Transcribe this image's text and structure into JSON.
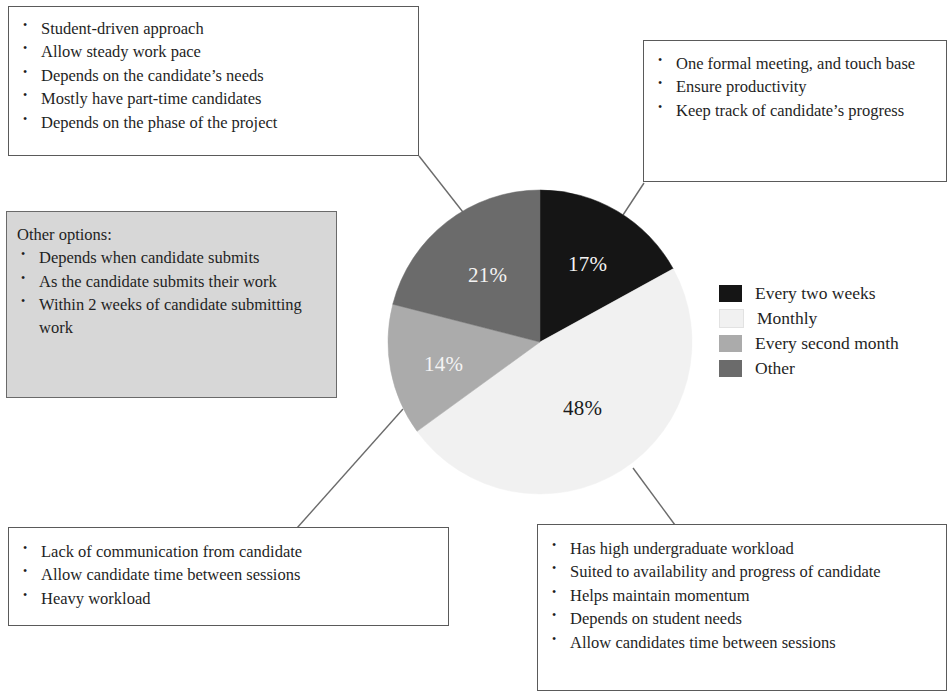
{
  "chart_data": {
    "type": "pie",
    "title": "",
    "categories": [
      "Every two weeks",
      "Monthly",
      "Every second month",
      "Other"
    ],
    "values": [
      17,
      48,
      14,
      21
    ],
    "value_labels": [
      "17%",
      "48%",
      "14%",
      "21%"
    ],
    "colors": [
      "#151515",
      "#f1f1f1",
      "#ababab",
      "#6b6b6b"
    ],
    "label_text_colors": [
      "#f4f4f4",
      "#1b1b1b",
      "#f4f4f4",
      "#f4f4f4"
    ],
    "start_angle_deg": 0,
    "direction": "clockwise",
    "legend_position": "right",
    "grid": false
  },
  "legend": {
    "items": [
      {
        "label": "Every two weeks",
        "color": "#151515"
      },
      {
        "label": "Monthly",
        "color": "#f1f1f1"
      },
      {
        "label": "Every second month",
        "color": "#ababab"
      },
      {
        "label": "Other",
        "color": "#6b6b6b"
      }
    ]
  },
  "callouts": {
    "top_left": {
      "items": [
        "Student-driven approach",
        "Allow steady work pace",
        "Depends on the candidate’s needs",
        "Mostly have part-time candidates",
        "Depends on the phase of the project"
      ]
    },
    "top_right": {
      "items": [
        "One formal meeting, and touch base",
        "Ensure productivity",
        "Keep track of candidate’s progress"
      ]
    },
    "other_options": {
      "heading": "Other options:",
      "items": [
        "Depends when candidate submits",
        "As the candidate submits their work",
        "Within 2 weeks of candidate submitting work"
      ]
    },
    "bottom_left": {
      "items": [
        "Lack of communication from candidate",
        "Allow candidate time between sessions",
        "Heavy workload"
      ]
    },
    "bottom_right": {
      "items": [
        "Has high undergraduate workload",
        "Suited to availability and progress of candidate",
        "Helps maintain momentum",
        "Depends on student needs",
        "Allow candidates time between sessions"
      ]
    }
  }
}
